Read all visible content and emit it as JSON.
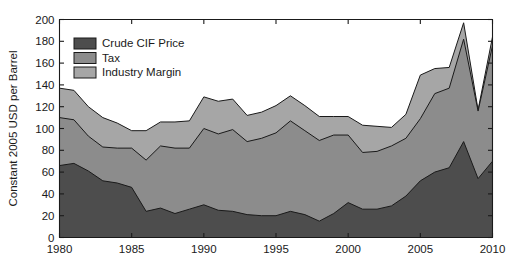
{
  "chart_data": {
    "type": "area",
    "stacked": true,
    "title": "",
    "subtitle": "",
    "xlabel": "",
    "ylabel": "Constant 2005 USD per Barrel",
    "xlim": [
      1980,
      2010
    ],
    "ylim": [
      0,
      200
    ],
    "ytick_values": [
      0,
      20,
      40,
      60,
      80,
      100,
      120,
      140,
      160,
      180,
      200
    ],
    "ytick_labels": [
      "0",
      "20",
      "40",
      "60",
      "80",
      "100",
      "120",
      "140",
      "160",
      "180",
      "200"
    ],
    "xtick_values": [
      1980,
      1985,
      1990,
      1995,
      2000,
      2005,
      2010
    ],
    "xtick_labels": [
      "1980",
      "1985",
      "1990",
      "1995",
      "2000",
      "2005",
      "2010"
    ],
    "grid": false,
    "legend_position": "upper-left",
    "x": [
      1980,
      1981,
      1982,
      1983,
      1984,
      1985,
      1986,
      1987,
      1988,
      1989,
      1990,
      1991,
      1992,
      1993,
      1994,
      1995,
      1996,
      1997,
      1998,
      1999,
      2000,
      2001,
      2002,
      2003,
      2004,
      2005,
      2006,
      2007,
      2008,
      2009,
      2010
    ],
    "series": [
      {
        "name": "Crude CIF Price",
        "color": "#4d4d4d",
        "values": [
          66,
          68,
          61,
          52,
          50,
          46,
          24,
          27,
          22,
          26,
          30,
          25,
          24,
          21,
          20,
          20,
          24,
          21,
          15,
          22,
          32,
          26,
          26,
          29,
          38,
          52,
          60,
          64,
          88,
          54,
          70
        ]
      },
      {
        "name": "Tax",
        "color": "#8c8c8c",
        "values": [
          44,
          40,
          32,
          31,
          32,
          36,
          47,
          57,
          60,
          56,
          70,
          70,
          75,
          67,
          71,
          76,
          83,
          77,
          74,
          72,
          62,
          52,
          53,
          55,
          53,
          57,
          72,
          73,
          94,
          62,
          106
        ]
      },
      {
        "name": "Industry Margin",
        "color": "#a6a6a6",
        "values": [
          27,
          27,
          27,
          27,
          23,
          16,
          27,
          22,
          24,
          25,
          29,
          30,
          28,
          24,
          24,
          25,
          23,
          23,
          22,
          17,
          17,
          25,
          23,
          17,
          22,
          40,
          23,
          19,
          15,
          1,
          8
        ]
      }
    ],
    "stack_totals": [
      137,
      135,
      120,
      110,
      105,
      98,
      98,
      106,
      106,
      107,
      129,
      125,
      127,
      112,
      115,
      121,
      130,
      121,
      111,
      111,
      111,
      103,
      102,
      101,
      113,
      149,
      155,
      156,
      197,
      117,
      184
    ]
  },
  "legend": {
    "entries": [
      {
        "label": "Crude CIF Price",
        "color": "#4d4d4d"
      },
      {
        "label": "Tax",
        "color": "#8c8c8c"
      },
      {
        "label": "Industry Margin",
        "color": "#a6a6a6"
      }
    ]
  },
  "axes": {
    "y_title": "Constant 2005 USD per Barrel"
  }
}
